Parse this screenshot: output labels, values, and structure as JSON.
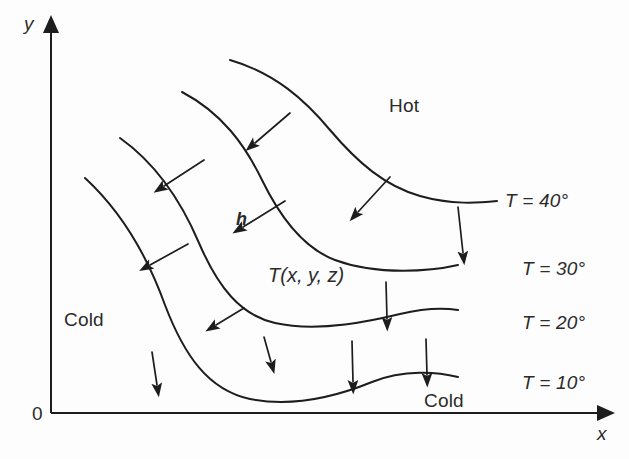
{
  "figure": {
    "background_color": "#fdfdfd",
    "line_color": "#1d1d1d",
    "text_color": "#2b2b2b"
  },
  "axes": {
    "x_label": "x",
    "y_label": "y",
    "origin_label": "0",
    "x_axis": {
      "x1": 51,
      "y1": 413,
      "x2": 600,
      "y2": 413
    },
    "y_axis": {
      "x1": 51,
      "y1": 413,
      "x2": 51,
      "y2": 30
    }
  },
  "regions": [
    {
      "name": "hot-region-label",
      "text": "Hot",
      "x": 389,
      "y": 96
    },
    {
      "name": "cold-region-label-left",
      "text": "Cold",
      "x": 64,
      "y": 310
    },
    {
      "name": "cold-region-label-bottom",
      "text": "Cold",
      "x": 424,
      "y": 391
    }
  ],
  "function_label": {
    "text": "T(x, y, z)",
    "x": 268,
    "y": 265
  },
  "gradient_label": {
    "text": "h",
    "x": 236,
    "y": 210
  },
  "isotherms": [
    {
      "name": "isotherm-40",
      "label": "T = 40°",
      "temperature": 40,
      "unit": "°",
      "label_x": 505,
      "label_y": 191,
      "path": "M230,60 C275,73 305,100 330,130 C358,163 385,186 420,196 C452,205 478,203 497,201"
    },
    {
      "name": "isotherm-30",
      "label": "T = 30°",
      "temperature": 30,
      "unit": "°",
      "label_x": 522,
      "label_y": 259,
      "path": "M182,92 C222,113 245,145 262,180 C280,217 303,248 335,260 C378,276 432,271 458,265"
    },
    {
      "name": "isotherm-20",
      "label": "T = 20°",
      "temperature": 20,
      "unit": "°",
      "label_x": 522,
      "label_y": 313,
      "path": "M120,138 C158,165 182,203 199,243 C218,287 240,315 275,323 C320,333 375,320 400,314 C425,308 445,308 458,310"
    },
    {
      "name": "isotherm-10",
      "label": "T = 10°",
      "temperature": 10,
      "unit": "°",
      "label_x": 522,
      "label_y": 373,
      "path": "M85,178 C123,213 148,258 165,305 C184,355 208,390 250,399 C295,408 340,395 372,382 C404,369 438,372 458,377"
    }
  ],
  "flux_arrows": [
    {
      "name": "flux-arrow-1",
      "x1": 204,
      "y1": 160,
      "x2": 164,
      "y2": 186
    },
    {
      "name": "flux-arrow-2",
      "x1": 290,
      "y1": 113,
      "x2": 255,
      "y2": 143
    },
    {
      "name": "flux-arrow-3",
      "x1": 390,
      "y1": 177,
      "x2": 358,
      "y2": 212
    },
    {
      "name": "flux-arrow-4",
      "x1": 285,
      "y1": 201,
      "x2": 243,
      "y2": 227
    },
    {
      "name": "flux-arrow-5",
      "x1": 458,
      "y1": 207,
      "x2": 463,
      "y2": 253
    },
    {
      "name": "flux-arrow-6",
      "x1": 188,
      "y1": 244,
      "x2": 150,
      "y2": 265
    },
    {
      "name": "flux-arrow-7",
      "x1": 244,
      "y1": 308,
      "x2": 216,
      "y2": 325
    },
    {
      "name": "flux-arrow-8",
      "x1": 386,
      "y1": 282,
      "x2": 387,
      "y2": 319
    },
    {
      "name": "flux-arrow-9",
      "x1": 264,
      "y1": 337,
      "x2": 271,
      "y2": 362
    },
    {
      "name": "flux-arrow-10",
      "x1": 352,
      "y1": 341,
      "x2": 353,
      "y2": 382
    },
    {
      "name": "flux-arrow-11",
      "x1": 426,
      "y1": 339,
      "x2": 427,
      "y2": 375
    },
    {
      "name": "flux-arrow-12",
      "x1": 152,
      "y1": 352,
      "x2": 157,
      "y2": 385
    }
  ]
}
